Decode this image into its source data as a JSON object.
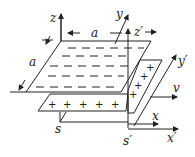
{
  "diagram": {
    "type": "physics-capacitor-frames",
    "labels": {
      "z": "z",
      "y": "y",
      "z_prime": "z′",
      "y_prime": "y′",
      "x": "x",
      "x_prime": "x′",
      "v": "v",
      "s": "s",
      "s_prime": "s′",
      "a_top": "a",
      "a_side": "a"
    },
    "top_plate_symbol": "−",
    "bottom_plate_symbol": "+",
    "side_plate_symbol": "+",
    "colors": {
      "line": "#222222",
      "background": "#ffffff"
    }
  }
}
